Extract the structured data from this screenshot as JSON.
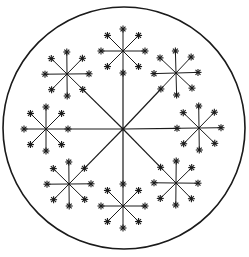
{
  "diagram": {
    "title": "Compound umbel diagram",
    "stroke_color": "#1a1a1a",
    "background": "#ffffff",
    "outer_circle": {
      "cx": 124,
      "cy": 128,
      "r": 121
    },
    "main_center": {
      "cx": 123,
      "cy": 129
    },
    "umbellets": [
      {
        "name": "top",
        "cx": 123,
        "cy": 51
      },
      {
        "name": "upper-right",
        "cx": 176,
        "cy": 73
      },
      {
        "name": "right",
        "cx": 199,
        "cy": 128
      },
      {
        "name": "lower-right",
        "cx": 176,
        "cy": 183
      },
      {
        "name": "bottom",
        "cx": 123,
        "cy": 206
      },
      {
        "name": "lower-left",
        "cx": 69,
        "cy": 184
      },
      {
        "name": "left",
        "cx": 46,
        "cy": 129
      },
      {
        "name": "upper-left",
        "cx": 67,
        "cy": 74
      }
    ],
    "ray_length": 22,
    "floret_size": 3.5
  }
}
